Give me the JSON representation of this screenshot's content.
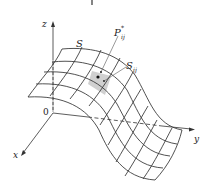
{
  "figure": {
    "surface_label": "S",
    "patch_label_main": "S",
    "patch_label_sub": "ij",
    "point_label_main": "P",
    "point_label_sup": "*",
    "point_label_sub": "ij",
    "axes": {
      "x": "x",
      "y": "y",
      "z": "z",
      "origin": "0"
    },
    "colors": {
      "line": "#333333",
      "patch_fill": "#d0d0d0",
      "background": "#ffffff"
    }
  }
}
